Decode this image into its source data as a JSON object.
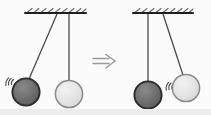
{
  "figure": {
    "background_color": "#fbfbfb",
    "width": 211,
    "height": 115,
    "bottom_band_color": "#eceded"
  },
  "colors": {
    "dark_ball_fill": "#6e6e6e",
    "dark_ball_stroke": "#2b2b2b",
    "light_ball_fill": "#e6e6e6",
    "light_ball_stroke": "#8a8a8a",
    "string": "#4a4a4a",
    "ceiling": "#1e1e1e",
    "hatch": "#555555",
    "arrow": "#9a9a9a",
    "motion_arc": "#4a4a4a"
  },
  "panels": [
    {
      "id": "left-panel",
      "name": "before-state",
      "ceiling": {
        "x1": 25,
        "x2": 86,
        "y": 13,
        "hatch_count": 9
      },
      "pivot": {
        "x": 69,
        "y": 14
      },
      "balls": [
        {
          "id": "dark-ball-left",
          "name": "dark-pendulum-ball",
          "shade": "dark",
          "cx": 26,
          "cy": 92,
          "r": 14,
          "string_from": {
            "x": 57,
            "y": 14
          },
          "motion_arcs": {
            "side": "left",
            "count": 3
          }
        },
        {
          "id": "light-ball-left",
          "name": "light-pendulum-ball",
          "shade": "light",
          "cx": 69,
          "cy": 94,
          "r": 14,
          "string_from": {
            "x": 69,
            "y": 14
          },
          "motion_arcs": null
        }
      ]
    },
    {
      "id": "right-panel",
      "name": "after-state",
      "ceiling": {
        "x1": 133,
        "x2": 193,
        "y": 13,
        "hatch_count": 9
      },
      "pivot": {
        "x": 148,
        "y": 14
      },
      "balls": [
        {
          "id": "dark-ball-right",
          "name": "dark-pendulum-ball",
          "shade": "dark",
          "cx": 148,
          "cy": 95,
          "r": 14,
          "string_from": {
            "x": 148,
            "y": 14
          },
          "motion_arcs": null
        },
        {
          "id": "light-ball-right",
          "name": "light-pendulum-ball",
          "shade": "light",
          "cx": 186,
          "cy": 88,
          "r": 14,
          "string_from": {
            "x": 163,
            "y": 14
          },
          "motion_arcs": {
            "side": "left",
            "count": 3
          }
        }
      ]
    }
  ],
  "arrow": {
    "name": "implies-arrow",
    "glyph": "⟹",
    "x": 93,
    "y": 55,
    "width": 22,
    "height": 13,
    "label": "implies"
  }
}
